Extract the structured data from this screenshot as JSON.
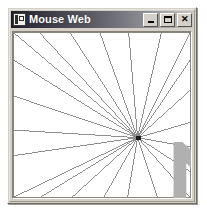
{
  "window": {
    "title": "Mouse Web",
    "icon": "application-window-icon",
    "frame_color": "#d4d0c8",
    "titlebar_gradient_from": "#1b1b24",
    "titlebar_gradient_to": "#c8c6c2",
    "title_text_color": "#ffffff",
    "client_background": "#ffffff",
    "buttons": [
      {
        "name": "minimize",
        "label": "_",
        "tooltip": "Minimize"
      },
      {
        "name": "maximize",
        "label": "□",
        "tooltip": "Maximize"
      },
      {
        "name": "close",
        "label": "✕",
        "tooltip": "Close"
      }
    ]
  },
  "canvas": {
    "description": "Radial web of straight lines drawn from the window edges to a single mouse point",
    "line_color": "#8a8a8a",
    "line_width": 1,
    "border_color": "#868279",
    "viewbox": {
      "width": 180,
      "height": 176
    },
    "hub": {
      "x": 126,
      "y": 112
    },
    "hub_marker_color": "#1a1a1a",
    "cursor": {
      "x": 130,
      "y": 117,
      "type": "arrow-pointer"
    },
    "endpoints": [
      {
        "x": 1,
        "y": 1
      },
      {
        "x": 1,
        "y": 30
      },
      {
        "x": 1,
        "y": 68
      },
      {
        "x": 1,
        "y": 104
      },
      {
        "x": 1,
        "y": 131
      },
      {
        "x": 1,
        "y": 175
      },
      {
        "x": 28,
        "y": 175
      },
      {
        "x": 60,
        "y": 175
      },
      {
        "x": 92,
        "y": 175
      },
      {
        "x": 116,
        "y": 175
      },
      {
        "x": 146,
        "y": 175
      },
      {
        "x": 179,
        "y": 175
      },
      {
        "x": 179,
        "y": 148
      },
      {
        "x": 179,
        "y": 122
      },
      {
        "x": 179,
        "y": 96
      },
      {
        "x": 179,
        "y": 62
      },
      {
        "x": 179,
        "y": 30
      },
      {
        "x": 179,
        "y": 1
      },
      {
        "x": 150,
        "y": 1
      },
      {
        "x": 117,
        "y": 1
      },
      {
        "x": 88,
        "y": 1
      },
      {
        "x": 58,
        "y": 1
      },
      {
        "x": 27,
        "y": 1
      }
    ]
  }
}
